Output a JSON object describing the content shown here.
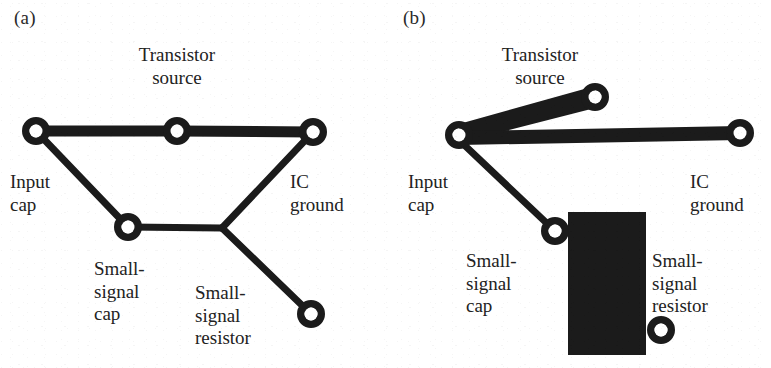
{
  "figure": {
    "width": 771,
    "height": 368,
    "background_color": "#ffffff",
    "ink_color": "#1b1b1b"
  },
  "panels": [
    {
      "id": "a",
      "label": "(a)",
      "label_pos": {
        "x": 14,
        "y": 8
      },
      "nodes": [
        {
          "id": "input-cap",
          "cx": 36,
          "cy": 131,
          "r_outer": 14,
          "r_inner": 6.5
        },
        {
          "id": "transistor-source",
          "cx": 177,
          "cy": 131,
          "r_outer": 14,
          "r_inner": 6.5
        },
        {
          "id": "ic-ground",
          "cx": 313,
          "cy": 132,
          "r_outer": 14,
          "r_inner": 6.5
        },
        {
          "id": "small-signal-cap",
          "cx": 128,
          "cy": 227,
          "r_outer": 14,
          "r_inner": 6.5
        },
        {
          "id": "small-signal-resistor",
          "cx": 311,
          "cy": 314,
          "r_outer": 14,
          "r_inner": 6.5
        }
      ],
      "branches": [
        {
          "id": "input-cap-to-transistor-source",
          "from": [
            36,
            131
          ],
          "to": [
            177,
            131
          ],
          "width": 11
        },
        {
          "id": "transistor-source-to-ic-ground",
          "from": [
            177,
            131
          ],
          "to": [
            313,
            132
          ],
          "width": 11
        },
        {
          "id": "input-cap-to-small-signal-cap",
          "from": [
            36,
            131
          ],
          "to": [
            128,
            227
          ],
          "width": 7
        },
        {
          "id": "small-signal-cap-to-junction",
          "from": [
            128,
            227
          ],
          "to": [
            222,
            228
          ],
          "width": 7
        },
        {
          "id": "junction-to-ic-ground",
          "from": [
            222,
            228
          ],
          "to": [
            313,
            132
          ],
          "width": 7
        },
        {
          "id": "junction-to-small-signal-resistor",
          "from": [
            222,
            228
          ],
          "to": [
            311,
            314
          ],
          "width": 7
        }
      ],
      "labels": [
        {
          "id": "transistor-source",
          "lines": [
            "Transistor",
            "source"
          ],
          "x": 177,
          "y": 44,
          "align": "center"
        },
        {
          "id": "input-cap",
          "lines": [
            "Input",
            "cap"
          ],
          "x": 10,
          "y": 171,
          "align": "left"
        },
        {
          "id": "ic-ground",
          "lines": [
            "IC",
            "ground"
          ],
          "x": 290,
          "y": 171,
          "align": "left"
        },
        {
          "id": "small-signal-cap",
          "lines": [
            "Small-",
            "signal",
            "cap"
          ],
          "x": 94,
          "y": 258,
          "align": "left"
        },
        {
          "id": "small-signal-resistor",
          "lines": [
            "Small-",
            "signal",
            "resistor"
          ],
          "x": 195,
          "y": 282,
          "align": "left"
        }
      ]
    },
    {
      "id": "b",
      "label": "(b)",
      "label_pos": {
        "x": 403,
        "y": 8
      },
      "nodes": [
        {
          "id": "input-cap",
          "cx": 459,
          "cy": 135,
          "r_outer": 14,
          "r_inner": 6.5
        },
        {
          "id": "transistor-source",
          "cx": 595,
          "cy": 97,
          "r_outer": 14,
          "r_inner": 6.5
        },
        {
          "id": "ic-ground",
          "cx": 740,
          "cy": 133,
          "r_outer": 14,
          "r_inner": 6.5
        },
        {
          "id": "small-signal-cap",
          "cx": 555,
          "cy": 231,
          "r_outer": 14,
          "r_inner": 6.5
        },
        {
          "id": "small-signal-resistor",
          "cx": 661,
          "cy": 330,
          "r_outer": 14,
          "r_inner": 6.5
        }
      ],
      "wedge": {
        "id": "transistor-source-return-loop",
        "points": "459,124 595,86 595,108 470,140 459,146"
      },
      "branches": [
        {
          "id": "input-cap-to-ic-ground",
          "from": [
            459,
            138
          ],
          "to": [
            740,
            133
          ],
          "width": 14
        },
        {
          "id": "input-cap-to-small-signal-cap",
          "from": [
            459,
            140
          ],
          "to": [
            555,
            231
          ],
          "width": 7
        }
      ],
      "plate": {
        "id": "small-signal-cap-to-resistor-plane",
        "x": 568,
        "y": 212,
        "width": 78,
        "height": 143
      },
      "labels": [
        {
          "id": "transistor-source",
          "lines": [
            "Transistor",
            "source"
          ],
          "x": 540,
          "y": 44,
          "align": "center"
        },
        {
          "id": "input-cap",
          "lines": [
            "Input",
            "cap"
          ],
          "x": 408,
          "y": 171,
          "align": "left"
        },
        {
          "id": "ic-ground",
          "lines": [
            "IC",
            "ground"
          ],
          "x": 690,
          "y": 171,
          "align": "left"
        },
        {
          "id": "small-signal-cap",
          "lines": [
            "Small-",
            "signal",
            "cap"
          ],
          "x": 466,
          "y": 250,
          "align": "left"
        },
        {
          "id": "small-signal-resistor",
          "lines": [
            "Small-",
            "signal",
            "resistor"
          ],
          "x": 652,
          "y": 250,
          "align": "left"
        }
      ]
    }
  ]
}
